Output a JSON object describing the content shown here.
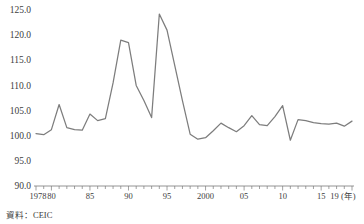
{
  "figure": {
    "source_note": "資料：CEIC",
    "background_color": "#ffffff",
    "line_color": "#7d7d7d",
    "axis_color": "#7a7a7a",
    "text_color": "#3d3d3d"
  },
  "chart_data": {
    "type": "line",
    "title": "",
    "subtitle": "",
    "xlabel": "(年)",
    "ylabel": "",
    "ylim": [
      90.0,
      125.0
    ],
    "xlim": [
      1978,
      2019
    ],
    "grid": false,
    "legend": false,
    "y_ticks": [
      "90.0",
      "95.0",
      "100.0",
      "105.0",
      "110.0",
      "115.0",
      "120.0",
      "125.0"
    ],
    "y_tick_values": [
      90.0,
      95.0,
      100.0,
      105.0,
      110.0,
      115.0,
      120.0,
      125.0
    ],
    "x_tick_labels": [
      "1978",
      "80",
      "85",
      "90",
      "95",
      "2000",
      "05",
      "10",
      "15",
      "19 (年)"
    ],
    "x_tick_values": [
      1978,
      1980,
      1985,
      1990,
      1995,
      2000,
      2005,
      2010,
      2015,
      2019
    ],
    "x_minor_interval": 1,
    "series": [
      {
        "name": "index",
        "x": [
          1978,
          1979,
          1980,
          1981,
          1982,
          1983,
          1984,
          1985,
          1986,
          1987,
          1988,
          1989,
          1990,
          1991,
          1992,
          1993,
          1994,
          1995,
          1996,
          1997,
          1998,
          1999,
          2000,
          2001,
          2002,
          2003,
          2004,
          2005,
          2006,
          2007,
          2008,
          2009,
          2010,
          2011,
          2012,
          2013,
          2014,
          2015,
          2016,
          2017,
          2018,
          2019
        ],
        "values": [
          100.4,
          100.2,
          101.2,
          106.2,
          101.6,
          101.2,
          101.1,
          104.3,
          103.0,
          103.4,
          110.5,
          119.0,
          118.5,
          110.0,
          107.0,
          103.6,
          124.2,
          121.0,
          114.0,
          107.0,
          100.3,
          99.3,
          99.6,
          101.0,
          102.5,
          101.6,
          100.8,
          102.0,
          104.0,
          102.2,
          102.0,
          103.8,
          106.0,
          99.1,
          103.2,
          103.0,
          102.6,
          102.4,
          102.3,
          102.5,
          101.9,
          102.9
        ]
      }
    ]
  }
}
